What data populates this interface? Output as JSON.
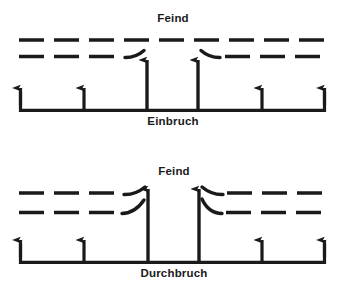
{
  "figure": {
    "background_color": "#ffffff",
    "stroke_color": "#1a1a1a",
    "panels": [
      {
        "id": "einbruch",
        "top_label": "Feind",
        "bottom_label": "Einbruch",
        "description": "Penetration: two attacking arrows pierce the first enemy line; the second enemy line bends back at the penetration shoulders but is not broken.",
        "enemy_lines": 2,
        "front_arrows": 4,
        "penetration_arrows": 2
      },
      {
        "id": "durchbruch",
        "top_label": "Feind",
        "bottom_label": "Durchbruch",
        "description": "Breakthrough: two attacking arrows pierce both enemy lines, which bend back on both shoulders of the gap.",
        "enemy_lines": 2,
        "front_arrows": 4,
        "penetration_arrows": 2
      }
    ],
    "labels": {
      "feind_top": "Feind",
      "einbruch": "Einbruch",
      "feind_bottom": "Feind",
      "durchbruch": "Durchbruch"
    },
    "geometry": {
      "panel_top": {
        "baseline_y": 110,
        "baseline_x1": 19,
        "baseline_x2": 326,
        "enemy_line_1_y": 40,
        "enemy_line_2_y": 56,
        "dash_x_start": 19,
        "dash_x_end": 326,
        "short_arrow_x": [
          19,
          84,
          262,
          326
        ],
        "short_arrow_tip_y": 86,
        "tall_arrow_x": [
          147,
          198
        ],
        "tall_arrow_tip_y": 57
      },
      "panel_bottom": {
        "baseline_y": 262,
        "baseline_x1": 19,
        "baseline_x2": 326,
        "enemy_line_1_y": 193,
        "enemy_line_2_y": 212,
        "dash_x_start": 19,
        "dash_x_end": 326,
        "short_arrow_x": [
          19,
          84,
          262,
          326
        ],
        "short_arrow_tip_y": 238,
        "tall_arrow_x": [
          148,
          199
        ],
        "tall_arrow_tip_y": 186
      }
    }
  }
}
